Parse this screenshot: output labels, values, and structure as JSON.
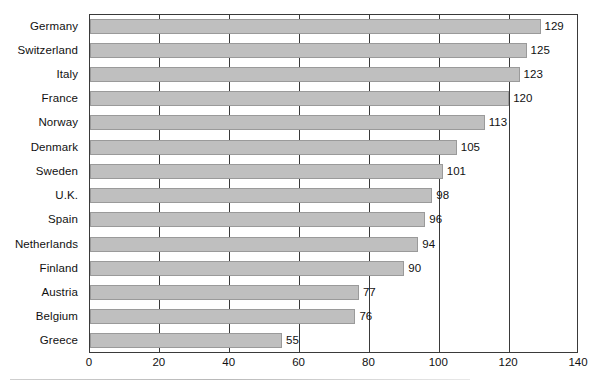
{
  "chart_data": {
    "type": "bar",
    "orientation": "horizontal",
    "title": "",
    "subtitle": "",
    "xlabel": "",
    "ylabel": "",
    "categories": [
      "Germany",
      "Switzerland",
      "Italy",
      "France",
      "Norway",
      "Denmark",
      "Sweden",
      "U.K.",
      "Spain",
      "Netherlands",
      "Finland",
      "Austria",
      "Belgium",
      "Greece"
    ],
    "values": [
      129,
      125,
      123,
      120,
      113,
      105,
      101,
      98,
      96,
      94,
      90,
      77,
      76,
      55
    ],
    "data_labels": [
      "129",
      "125",
      "123",
      "120",
      "113",
      "105",
      "101",
      "98",
      "96",
      "94",
      "90",
      "77",
      "76",
      "55"
    ],
    "xlim": [
      0,
      140
    ],
    "xticks": [
      0,
      20,
      40,
      60,
      80,
      100,
      120,
      140
    ],
    "xtick_labels": [
      "0",
      "20",
      "40",
      "60",
      "80",
      "100",
      "120",
      "140"
    ],
    "grid": "vertical",
    "legend": "none",
    "bar_color": "#bfbfbf",
    "bar_border_color": "#9a9a9a",
    "axis_color": "#3a3a3a",
    "text_color": "#111111",
    "background": "#ffffff"
  }
}
